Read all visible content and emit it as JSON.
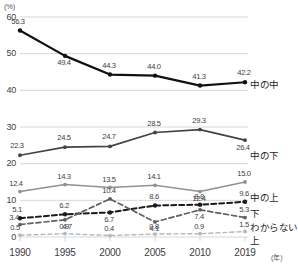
{
  "axes": {
    "y_unit": "(%)",
    "x_unit": "(年)",
    "y_ticks": [
      "0",
      "10",
      "20",
      "30",
      "40",
      "50",
      "60"
    ],
    "x_ticks": [
      "1990",
      "1995",
      "2000",
      "2005",
      "2010",
      "2019"
    ]
  },
  "series_labels": {
    "naka_no_naka": "中の中",
    "naka_no_shimo": "中の下",
    "naka_no_ue": "中の上",
    "shimo": "下",
    "wakaranai": "わからない",
    "ue": "上"
  },
  "colors": {
    "naka_no_naka": "#111111",
    "naka_no_shimo": "#3f4447",
    "naka_no_ue": "#8d9296",
    "shimo": "#1a1a1a",
    "wakaranai": "#5b6165",
    "ue": "#b3b8bc",
    "grid": "#c9cdd1",
    "text": "#3c4043"
  },
  "chart_data": {
    "type": "line",
    "title": "",
    "xlabel": "(年)",
    "ylabel": "(%)",
    "ylim": [
      0,
      60
    ],
    "grid": true,
    "legend_position": "right",
    "categories": [
      "1990",
      "1995",
      "2000",
      "2005",
      "2010",
      "2019"
    ],
    "series": [
      {
        "name": "中の中",
        "values": [
          56.3,
          49.4,
          44.3,
          44.0,
          41.3,
          42.2
        ],
        "style": "solid",
        "color": "#111111"
      },
      {
        "name": "中の下",
        "values": [
          22.3,
          24.5,
          24.7,
          28.5,
          29.3,
          26.4
        ],
        "style": "solid",
        "color": "#3f4447"
      },
      {
        "name": "中の上",
        "values": [
          12.4,
          14.3,
          13.5,
          14.1,
          12.4,
          15.0
        ],
        "style": "solid",
        "color": "#8d9296"
      },
      {
        "name": "下",
        "values": [
          5.1,
          6.2,
          6.7,
          8.6,
          8.8,
          9.6
        ],
        "style": "dashed",
        "color": "#1a1a1a"
      },
      {
        "name": "わからない",
        "values": [
          3.4,
          4.7,
          10.4,
          4.1,
          7.4,
          5.3
        ],
        "style": "dashed",
        "color": "#5b6165"
      },
      {
        "name": "上",
        "values": [
          0.5,
          0.9,
          0.4,
          0.8,
          0.9,
          1.5
        ],
        "style": "dashed",
        "color": "#b3b8bc"
      }
    ]
  },
  "data_labels": {
    "naka_no_naka": [
      "56.3",
      "49.4",
      "44.3",
      "44.0",
      "41.3",
      "42.2"
    ],
    "naka_no_shimo": [
      "22.3",
      "24.5",
      "24.7",
      "28.5",
      "29.3",
      "26.4"
    ],
    "naka_no_ue": [
      "12.4",
      "14.3",
      "13.5",
      "14.1",
      "12.4",
      "15.0"
    ],
    "shimo": [
      "5.1",
      "6.2",
      "6.7",
      "8.6",
      "8.8",
      "9.6"
    ],
    "wakaranai": [
      "3.4",
      "4.7",
      "10.4",
      "4.1",
      "7.4",
      "5.3"
    ],
    "ue": [
      "0.5",
      "0.9",
      "0.4",
      "0.8",
      "0.9",
      "1.5"
    ]
  }
}
